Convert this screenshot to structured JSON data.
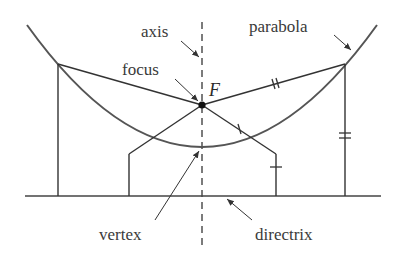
{
  "diagram": {
    "labels": {
      "axis": "axis",
      "focus": "focus",
      "focus_symbol": "F",
      "parabola": "parabola",
      "vertex": "vertex",
      "directrix": "directrix"
    },
    "colors": {
      "stroke": "#3a3a3a",
      "curve": "#555555",
      "background": "#ffffff"
    },
    "tick_marks": {
      "single": "equal distances (focus-to-inner point and inner point-to-directrix)",
      "double": "equal distances (focus-to-outer point and outer point-to-directrix)"
    }
  }
}
